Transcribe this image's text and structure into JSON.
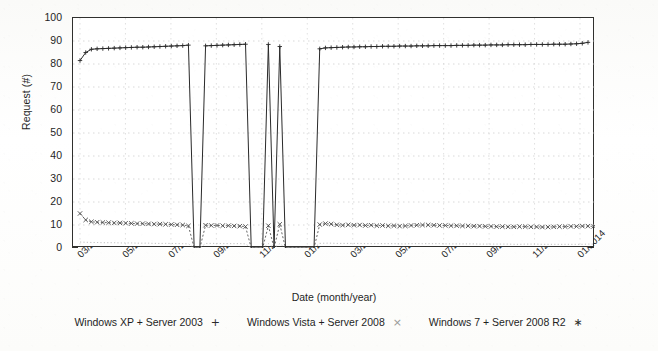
{
  "chart_data": {
    "type": "line",
    "title": "",
    "xlabel": "Date (month/year)",
    "ylabel": "Request (#)",
    "ylim": [
      0,
      100
    ],
    "ytick_step": 10,
    "yticks": [
      "0",
      "10",
      "20",
      "30",
      "40",
      "50",
      "60",
      "70",
      "80",
      "90",
      "100"
    ],
    "xticks": [
      "03/2012",
      "05/2012",
      "07/2012",
      "09/2012",
      "11/2012",
      "01/2013",
      "03/2013",
      "05/2013",
      "07/2013",
      "09/2013",
      "11/2013",
      "01/2014"
    ],
    "xlim": [
      "02/2012",
      "01/2014"
    ],
    "grid": true,
    "legend_position": "bottom",
    "series": [
      {
        "name": "Windows XP + Server 2003",
        "marker": "+",
        "style": "solid-line-with-points",
        "color": "#2a2a2a",
        "x": [
          "2012-02-20",
          "2012-02-27",
          "2012-03-05",
          "2012-03-12",
          "2012-03-19",
          "2012-03-26",
          "2012-04-02",
          "2012-04-09",
          "2012-04-16",
          "2012-04-23",
          "2012-04-30",
          "2012-05-07",
          "2012-05-14",
          "2012-05-21",
          "2012-05-28",
          "2012-06-04",
          "2012-06-11",
          "2012-06-18",
          "2012-06-25",
          "2012-07-02",
          "2012-07-09",
          "2012-07-16",
          "2012-07-23",
          "2012-07-30",
          "2012-08-06",
          "2012-08-13",
          "2012-08-20",
          "2012-08-27",
          "2012-09-03",
          "2012-09-10",
          "2012-09-17",
          "2012-09-24",
          "2012-10-01",
          "2012-10-08",
          "2012-10-15",
          "2012-10-22",
          "2012-10-29",
          "2012-11-05",
          "2012-11-12",
          "2012-11-19",
          "2012-11-26",
          "2012-12-03",
          "2012-12-10",
          "2012-12-17",
          "2012-12-24",
          "2012-12-31",
          "2013-01-07",
          "2013-01-14",
          "2013-01-21",
          "2013-01-28",
          "2013-02-04",
          "2013-02-11",
          "2013-02-18",
          "2013-02-25",
          "2013-03-04",
          "2013-03-11",
          "2013-03-18",
          "2013-03-25",
          "2013-04-01",
          "2013-04-08",
          "2013-04-15",
          "2013-04-22",
          "2013-04-29",
          "2013-05-06",
          "2013-05-13",
          "2013-05-20",
          "2013-05-27",
          "2013-06-03",
          "2013-06-10",
          "2013-06-17",
          "2013-06-24",
          "2013-07-01",
          "2013-07-08",
          "2013-07-15",
          "2013-07-22",
          "2013-07-29",
          "2013-08-05",
          "2013-08-12",
          "2013-08-19",
          "2013-08-26",
          "2013-09-02",
          "2013-09-09",
          "2013-09-16",
          "2013-09-23",
          "2013-09-30",
          "2013-10-07",
          "2013-10-14",
          "2013-10-21",
          "2013-10-28",
          "2013-11-04"
        ],
        "values": [
          81.5,
          85.0,
          86.4,
          86.6,
          86.7,
          86.8,
          86.9,
          87.0,
          87.1,
          87.2,
          87.3,
          87.3,
          87.4,
          87.5,
          87.6,
          87.7,
          87.8,
          87.9,
          88.0,
          88.2,
          0,
          0,
          87.9,
          88.0,
          88.1,
          88.2,
          88.3,
          88.4,
          88.5,
          88.6,
          0,
          0,
          0,
          88.5,
          0,
          87.6,
          0,
          0,
          0,
          0,
          0,
          0,
          86.6,
          87.0,
          87.1,
          87.2,
          87.3,
          87.4,
          87.4,
          87.5,
          87.5,
          87.6,
          87.6,
          87.7,
          87.7,
          87.7,
          87.8,
          87.8,
          87.8,
          87.9,
          87.9,
          87.9,
          88.0,
          88.0,
          88.0,
          88.0,
          88.1,
          88.1,
          88.1,
          88.2,
          88.2,
          88.2,
          88.3,
          88.3,
          88.3,
          88.4,
          88.4,
          88.4,
          88.4,
          88.5,
          88.5,
          88.5,
          88.5,
          88.6,
          88.6,
          88.6,
          88.7,
          88.8,
          89.0,
          89.4
        ]
      },
      {
        "name": "Windows Vista + Server 2008",
        "marker": "x",
        "style": "dotted-line-with-points",
        "color": "#4a4a4a",
        "values": [
          15.0,
          12.2,
          11.4,
          11.2,
          11.1,
          11.0,
          10.9,
          10.9,
          10.8,
          10.7,
          10.6,
          10.6,
          10.5,
          10.4,
          10.4,
          10.3,
          10.2,
          10.1,
          10.0,
          9.6,
          0,
          0,
          9.9,
          9.8,
          9.8,
          9.7,
          9.7,
          9.6,
          9.5,
          9.3,
          0,
          0,
          0,
          9.7,
          0,
          10.3,
          0,
          0,
          0,
          0,
          0,
          0,
          10.2,
          10.6,
          10.4,
          10.1,
          9.9,
          10.1,
          9.9,
          10.0,
          9.8,
          9.9,
          9.7,
          9.8,
          9.6,
          9.7,
          9.5,
          9.6,
          9.8,
          9.9,
          10.0,
          10.0,
          9.9,
          9.8,
          9.8,
          9.7,
          9.7,
          9.6,
          9.6,
          9.5,
          9.5,
          9.4,
          9.4,
          9.3,
          9.3,
          9.2,
          9.2,
          9.3,
          9.3,
          9.2,
          9.2,
          9.1,
          9.1,
          9.2,
          9.3,
          9.3,
          9.4,
          9.4,
          9.5,
          9.5,
          9.4
        ]
      },
      {
        "name": "Windows 7 + Server 2008 R2",
        "marker": "*",
        "style": "faint-dotted-line",
        "color": "#b0b0b0",
        "values": [
          2.6,
          2.5,
          2.4,
          2.4,
          2.3,
          2.3,
          2.3,
          2.2,
          2.2,
          2.2,
          2.1,
          2.1,
          2.1,
          2.0,
          2.0,
          2.0,
          2.0,
          1.9,
          1.9,
          1.8,
          0,
          0,
          2.0,
          2.0,
          2.0,
          1.9,
          1.9,
          1.9,
          1.9,
          1.8,
          0,
          0,
          0,
          1.9,
          0,
          1.9,
          0,
          0,
          0,
          0,
          0,
          0,
          2.0,
          2.1,
          2.1,
          2.0,
          2.0,
          2.0,
          2.0,
          2.0,
          1.9,
          1.9,
          1.9,
          1.9,
          1.9,
          1.9,
          1.8,
          1.8,
          1.9,
          1.9,
          1.9,
          1.9,
          1.9,
          1.9,
          1.8,
          1.8,
          1.8,
          1.8,
          1.8,
          1.8,
          1.7,
          1.7,
          1.7,
          1.7,
          1.7,
          1.7,
          1.6,
          1.6,
          1.7,
          1.7,
          1.7,
          1.6,
          1.6,
          1.6,
          1.6,
          1.6,
          1.6,
          1.6,
          1.6,
          1.7,
          1.7
        ]
      }
    ]
  },
  "legend": {
    "items": [
      {
        "label": "Windows XP + Server 2003",
        "key": "+"
      },
      {
        "label": "Windows Vista + Server 2008",
        "key": "×"
      },
      {
        "label": "Windows 7 + Server 2008 R2",
        "key": "∗"
      }
    ]
  }
}
